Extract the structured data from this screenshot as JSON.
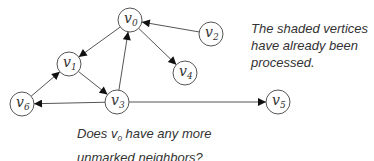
{
  "diagram": {
    "type": "directed-graph",
    "nodes": [
      {
        "id": "v0",
        "label": "v",
        "sub": "0",
        "x": 130,
        "y": 20
      },
      {
        "id": "v1",
        "label": "v",
        "sub": "1",
        "x": 69,
        "y": 64
      },
      {
        "id": "v2",
        "label": "v",
        "sub": "2",
        "x": 211,
        "y": 34
      },
      {
        "id": "v3",
        "label": "v",
        "sub": "3",
        "x": 117,
        "y": 102
      },
      {
        "id": "v4",
        "label": "v",
        "sub": "4",
        "x": 185,
        "y": 73
      },
      {
        "id": "v5",
        "label": "v",
        "sub": "5",
        "x": 278,
        "y": 102
      },
      {
        "id": "v6",
        "label": "v",
        "sub": "6",
        "x": 22,
        "y": 104
      }
    ],
    "edges": [
      {
        "from": "v2",
        "to": "v0"
      },
      {
        "from": "v0",
        "to": "v1"
      },
      {
        "from": "v0",
        "to": "v4"
      },
      {
        "from": "v1",
        "to": "v3"
      },
      {
        "from": "v3",
        "to": "v0"
      },
      {
        "from": "v6",
        "to": "v1"
      },
      {
        "from": "v3",
        "to": "v6"
      },
      {
        "from": "v3",
        "to": "v5"
      }
    ],
    "node_radius": 12
  },
  "notes": {
    "shaded": {
      "line1": "The shaded vertices",
      "line2": "have already been",
      "line3": "processed."
    },
    "question": {
      "pre": "Does v",
      "sub": "0",
      "post": " have any more",
      "line2": "unmarked neighbors?"
    }
  }
}
